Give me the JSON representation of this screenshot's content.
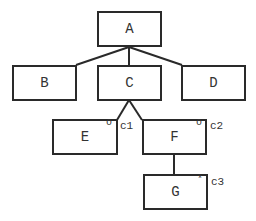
{
  "diagram": {
    "nodes": [
      {
        "id": "A",
        "label": "A"
      },
      {
        "id": "B",
        "label": "B"
      },
      {
        "id": "C",
        "label": "C"
      },
      {
        "id": "D",
        "label": "D"
      },
      {
        "id": "E",
        "label": "E",
        "marker": "o",
        "annotation": "c1"
      },
      {
        "id": "F",
        "label": "F",
        "marker": "o",
        "annotation": "c2"
      },
      {
        "id": "G",
        "label": "G",
        "marker": "*",
        "annotation": "c3"
      }
    ],
    "edges": [
      {
        "from": "A",
        "to": "B"
      },
      {
        "from": "A",
        "to": "C"
      },
      {
        "from": "A",
        "to": "D"
      },
      {
        "from": "C",
        "to": "E"
      },
      {
        "from": "C",
        "to": "F"
      },
      {
        "from": "F",
        "to": "G"
      }
    ]
  }
}
